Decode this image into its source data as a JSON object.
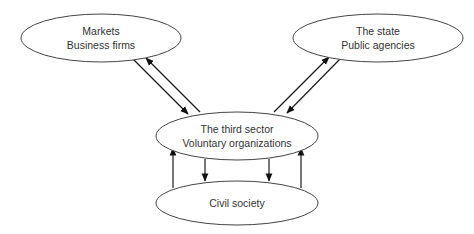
{
  "diagram": {
    "type": "relationship-diagram",
    "colors": {
      "background": "#ffffff",
      "node_stroke": "#444444",
      "edge_stroke": "#1a1a1a",
      "text": "#333333"
    },
    "nodes": [
      {
        "id": "markets",
        "lines": [
          "Markets",
          "Business firms"
        ],
        "shape": "ellipse",
        "cx": 101,
        "cy": 38,
        "rx": 80,
        "ry": 24
      },
      {
        "id": "state",
        "lines": [
          "The state",
          "Public agencies"
        ],
        "shape": "ellipse",
        "cx": 378,
        "cy": 38,
        "rx": 85,
        "ry": 24
      },
      {
        "id": "third_sector",
        "lines": [
          "The third sector",
          "Voluntary organizations"
        ],
        "shape": "ellipse",
        "cx": 237,
        "cy": 136,
        "rx": 81,
        "ry": 24
      },
      {
        "id": "civil_society",
        "lines": [
          "Civil society"
        ],
        "shape": "ellipse",
        "cx": 237,
        "cy": 203,
        "rx": 81,
        "ry": 22
      }
    ],
    "edges": [
      {
        "from": "markets",
        "to": "third_sector",
        "x1": 133,
        "y1": 59,
        "x2": 188,
        "y2": 114
      },
      {
        "from": "third_sector",
        "to": "markets",
        "x1": 200,
        "y1": 112,
        "x2": 146,
        "y2": 58
      },
      {
        "from": "third_sector",
        "to": "state",
        "x1": 274,
        "y1": 112,
        "x2": 329,
        "y2": 57
      },
      {
        "from": "state",
        "to": "third_sector",
        "x1": 341,
        "y1": 58,
        "x2": 287,
        "y2": 113
      },
      {
        "from": "civil_society",
        "to": "third_sector",
        "x1": 173,
        "y1": 188,
        "x2": 173,
        "y2": 148
      },
      {
        "from": "third_sector",
        "to": "civil_society",
        "x1": 205,
        "y1": 159,
        "x2": 205,
        "y2": 181
      },
      {
        "from": "third_sector",
        "to": "civil_society",
        "x1": 269,
        "y1": 159,
        "x2": 269,
        "y2": 181
      },
      {
        "from": "civil_society",
        "to": "third_sector",
        "x1": 301,
        "y1": 188,
        "x2": 301,
        "y2": 148
      }
    ]
  }
}
